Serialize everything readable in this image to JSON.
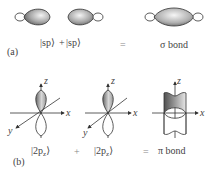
{
  "panel_a": {
    "tag": "(a)",
    "left_term": "|sp⟩",
    "plus": "+",
    "right_term": "|sp⟩",
    "equals": "=",
    "result": "σ bond"
  },
  "panel_b": {
    "tag": "(b)",
    "term1_prefix": "|2p",
    "term1_sub": "z",
    "term1_suffix": "⟩",
    "plus": "+",
    "term2_prefix": "|2p",
    "term2_sub": "z",
    "term2_suffix": "⟩",
    "equals": "=",
    "result": "π bond",
    "axes": {
      "x": "x",
      "y": "y",
      "z": "z"
    }
  },
  "colors": {
    "lobe_dark": "#555555",
    "lobe_light": "#f2f2f2",
    "line": "#333333"
  }
}
